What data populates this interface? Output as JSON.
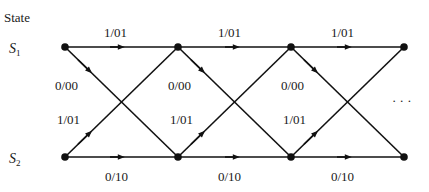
{
  "diagram": {
    "title": "State",
    "states": [
      {
        "name": "S",
        "sub": "1"
      },
      {
        "name": "S",
        "sub": "2"
      }
    ],
    "stage_x": [
      65,
      178,
      291,
      404
    ],
    "row_y": [
      47,
      157
    ],
    "edges": {
      "s1_to_s1": "1/01",
      "s1_to_s2": "0/00",
      "s2_to_s1": "1/01",
      "s2_to_s2": "0/10"
    },
    "labels": {
      "top": [
        "1/01",
        "1/01",
        "1/01"
      ],
      "diag_down": [
        "0/00",
        "0/00",
        "0/00"
      ],
      "diag_up": [
        "1/01",
        "1/01",
        "1/01"
      ],
      "bottom": [
        "0/10",
        "0/10",
        "0/10"
      ]
    },
    "ellipsis": "· · ·",
    "color": "#111111"
  }
}
